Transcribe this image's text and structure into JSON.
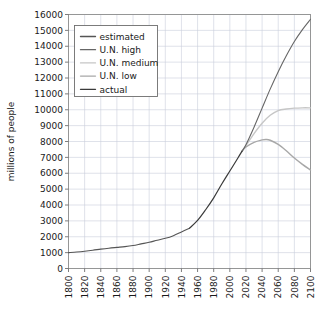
{
  "chart_data": {
    "type": "line",
    "title": "",
    "subtitle": "",
    "xlabel": "",
    "ylabel": "millions of people",
    "xlim": [
      1800,
      2100
    ],
    "ylim": [
      0,
      16000
    ],
    "grid": true,
    "legend_position": "top-left",
    "x_ticks": [
      1800,
      1820,
      1840,
      1860,
      1880,
      1900,
      1920,
      1940,
      1960,
      1980,
      2000,
      2020,
      2040,
      2060,
      2080,
      2100
    ],
    "y_ticks": [
      0,
      1000,
      2000,
      3000,
      4000,
      5000,
      6000,
      7000,
      8000,
      9000,
      10000,
      11000,
      12000,
      13000,
      14000,
      15000,
      16000
    ],
    "x_tick_labels": [
      "1800",
      "1820",
      "1840",
      "1860",
      "1880",
      "1900",
      "1920",
      "1940",
      "1960",
      "1980",
      "2000",
      "2020",
      "2040",
      "2060",
      "2080",
      "2100"
    ],
    "y_tick_labels": [
      "0",
      "1000",
      "2000",
      "3000",
      "4000",
      "5000",
      "6000",
      "7000",
      "8000",
      "9000",
      "10000",
      "11000",
      "12000",
      "13000",
      "14000",
      "15000",
      "16000"
    ],
    "series": [
      {
        "name": "estimated",
        "color": "#555555",
        "width": 1.1,
        "x": [
          1800,
          1810,
          1820,
          1830,
          1840,
          1850,
          1860,
          1870,
          1880,
          1890,
          1900,
          1910,
          1920,
          1930,
          1940,
          1950
        ],
        "values": [
          1000,
          1040,
          1090,
          1150,
          1220,
          1280,
          1330,
          1380,
          1450,
          1550,
          1650,
          1780,
          1900,
          2070,
          2300,
          2540
        ]
      },
      {
        "name": "U.N. high",
        "color": "#666666",
        "width": 1.1,
        "x": [
          2015,
          2020,
          2030,
          2040,
          2050,
          2060,
          2070,
          2080,
          2090,
          2100
        ],
        "values": [
          7380,
          7800,
          8900,
          10100,
          11300,
          12400,
          13400,
          14300,
          15050,
          15700
        ]
      },
      {
        "name": "U.N. medium",
        "color": "#c6c6c6",
        "width": 1.4,
        "x": [
          2015,
          2020,
          2030,
          2040,
          2050,
          2060,
          2070,
          2080,
          2090,
          2100
        ],
        "values": [
          7380,
          7750,
          8500,
          9150,
          9650,
          9950,
          10050,
          10100,
          10120,
          10120
        ]
      },
      {
        "name": "U.N. low",
        "color": "#a8a8a8",
        "width": 1.4,
        "x": [
          2015,
          2020,
          2030,
          2040,
          2045,
          2050,
          2060,
          2070,
          2080,
          2090,
          2100
        ],
        "values": [
          7380,
          7650,
          7950,
          8100,
          8130,
          8080,
          7820,
          7420,
          6960,
          6560,
          6200
        ]
      },
      {
        "name": "actual",
        "color": "#3a3a3a",
        "width": 1.2,
        "x": [
          1950,
          1960,
          1970,
          1980,
          1990,
          2000,
          2010,
          2015
        ],
        "values": [
          2540,
          3030,
          3700,
          4450,
          5320,
          6140,
          6960,
          7380
        ]
      }
    ],
    "legend_entries": [
      {
        "label": "estimated",
        "color": "#555555"
      },
      {
        "label": "U.N. high",
        "color": "#666666"
      },
      {
        "label": "U.N. medium",
        "color": "#c6c6c6"
      },
      {
        "label": "U.N. low",
        "color": "#a8a8a8"
      },
      {
        "label": "actual",
        "color": "#3a3a3a"
      }
    ]
  },
  "axes": {
    "y_axis_title": "millions of people"
  }
}
